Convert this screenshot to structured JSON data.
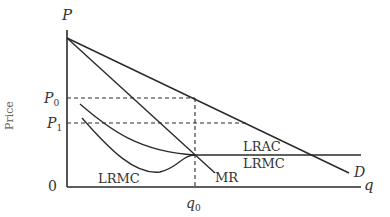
{
  "diagram": {
    "title": "",
    "axes": {
      "y_symbol": "P",
      "y_title": "Price",
      "x_symbol": "q",
      "origin": "0"
    },
    "price_levels": [
      {
        "symbol": "P",
        "subscript": "0"
      },
      {
        "symbol": "P",
        "subscript": "1"
      }
    ],
    "quantity_levels": [
      {
        "symbol": "q",
        "subscript": "0"
      }
    ],
    "curves": {
      "demand": "D",
      "marginal_revenue": "MR",
      "lrac": "LRAC",
      "lrmc_flat": "LRMC",
      "lrmc_curve": "LRMC"
    },
    "colors": {
      "line": "#2a2a2a",
      "text": "#333333",
      "axis_title": "#666666"
    }
  }
}
